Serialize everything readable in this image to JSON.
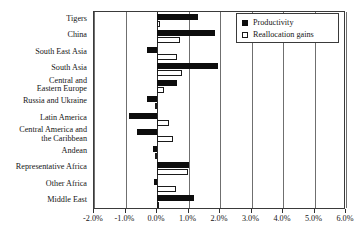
{
  "chart_data": {
    "type": "bar",
    "orientation": "horizontal",
    "title": "",
    "xlabel": "",
    "ylabel": "",
    "xlim": [
      -2.0,
      6.0
    ],
    "xticks": [
      -2.0,
      -1.0,
      0.0,
      1.0,
      2.0,
      3.0,
      4.0,
      5.0,
      6.0
    ],
    "xtick_labels": [
      "-2.0%",
      "-1.0%",
      "0.0%",
      "1.0%",
      "2.0%",
      "3.0%",
      "4.0%",
      "5.0%",
      "6.0%"
    ],
    "grid": true,
    "legend_position": "top-right",
    "categories": [
      "Tigers",
      "China",
      "South East Asia",
      "South Asia",
      "Central and\nEastern Europe",
      "Russia and Ukraine",
      "Latin America",
      "Central America and\nthe Caribbean",
      "Andean",
      "Representative Africa",
      "Other Africa",
      "Middle East"
    ],
    "series": [
      {
        "name": "Productivity",
        "color": "#0d0d0d",
        "style": "filled",
        "values": [
          1.3,
          1.83,
          -0.33,
          1.95,
          0.63,
          -0.31,
          -0.88,
          -0.64,
          -0.13,
          1.0,
          -0.1,
          1.17
        ]
      },
      {
        "name": "Reallocation gains",
        "color": "#ffffff",
        "style": "hollow",
        "values": [
          0.1,
          0.72,
          0.62,
          0.78,
          0.22,
          -0.05,
          0.38,
          0.5,
          -0.06,
          0.99,
          0.59,
          0.03
        ]
      }
    ]
  },
  "legend": {
    "items": [
      {
        "label": "Productivity",
        "style": "filled"
      },
      {
        "label": "Reallocation gains",
        "style": "hollow"
      }
    ]
  }
}
